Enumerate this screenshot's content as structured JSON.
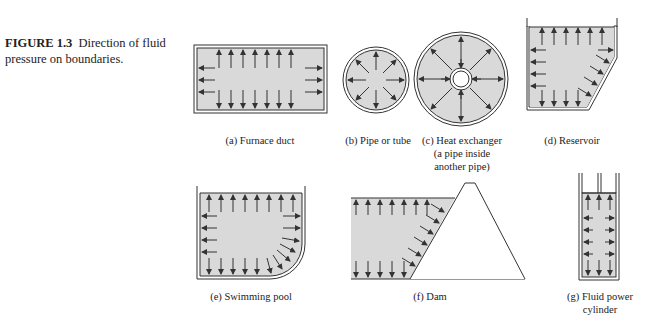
{
  "caption": {
    "figure_number": "FIGURE 1.3",
    "text": "Direction of fluid pressure on boundaries."
  },
  "colors": {
    "fluid_fill": "#d9d9d9",
    "stroke": "#333333",
    "background": "#ffffff"
  },
  "panels": [
    {
      "id": "a",
      "label": "(a) Furnace duct"
    },
    {
      "id": "b",
      "label": "(b) Pipe or tube"
    },
    {
      "id": "c",
      "label_lines": [
        "(c) Heat exchanger",
        "(a pipe inside",
        "another pipe)"
      ]
    },
    {
      "id": "d",
      "label": "(d) Reservoir"
    },
    {
      "id": "e",
      "label": "(e) Swimming pool"
    },
    {
      "id": "f",
      "label": "(f) Dam"
    },
    {
      "id": "g",
      "label_lines": [
        "(g) Fluid power",
        "cylinder"
      ]
    }
  ]
}
